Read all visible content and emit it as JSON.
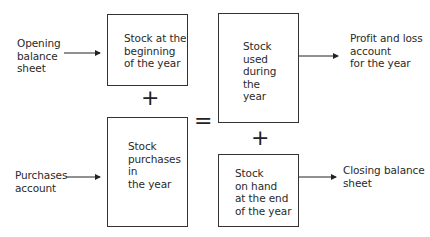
{
  "diagram": {
    "inputs": {
      "opening_balance": "Opening\nbalance\nsheet",
      "purchases_account": "Purchases\naccount"
    },
    "boxes": {
      "stock_beginning": "Stock at the\nbeginning\nof the year",
      "stock_purchases": "Stock\npurchases\nin\nthe year",
      "stock_used": "Stock\nused\nduring\nthe\nyear",
      "stock_on_hand": "Stock\non hand\nat the end\nof the year"
    },
    "outputs": {
      "profit_and_loss": "Profit and loss\naccount\nfor the year",
      "closing_balance": "Closing balance\nsheet"
    },
    "operators": {
      "plus_left": "+",
      "equals": "=",
      "plus_right": "+"
    }
  }
}
